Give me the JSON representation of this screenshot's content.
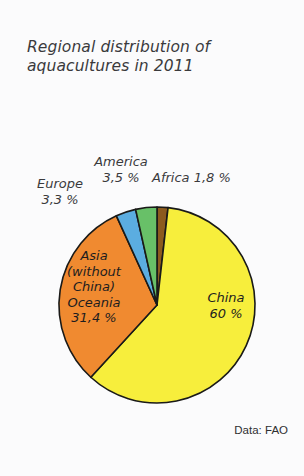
{
  "title": "Regional distribution of\naquacultures in 2011",
  "source_note": "Data: FAO",
  "labels": {
    "china": "China\n60 %",
    "asia": "Asia\n(without\nChina)\nOceania\n31,4 %",
    "europe": "Europe\n3,3 %",
    "america": "America\n3,5 %",
    "africa": "Africa 1,8 %"
  },
  "colors": {
    "background": "#fbfbfc",
    "text": "#3a3a3c",
    "stroke": "#1a1a18",
    "china": "#f7ee3c",
    "asia": "#f08a30",
    "europe": "#5bade0",
    "america": "#68c068",
    "africa": "#8c5a1e"
  },
  "chart_data": {
    "type": "pie",
    "title": "Regional distribution of aquacultures in 2011",
    "categories": [
      "Africa",
      "China",
      "Asia (without China) Oceania",
      "Europe",
      "America"
    ],
    "values": [
      1.8,
      60.0,
      31.4,
      3.3,
      3.5
    ],
    "value_labels": [
      "1,8 %",
      "60 %",
      "31,4 %",
      "3,3 %",
      "3,5 %"
    ],
    "unit": "percent",
    "slice_colors": [
      "#8c5a1e",
      "#f7ee3c",
      "#f08a30",
      "#5bade0",
      "#68c068"
    ],
    "start_angle_deg": 0,
    "direction": "clockwise",
    "legend": "none",
    "label_placement": [
      "callout",
      "inside",
      "inside",
      "callout",
      "callout"
    ],
    "source": "Data: FAO"
  }
}
